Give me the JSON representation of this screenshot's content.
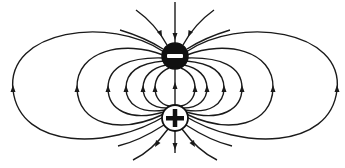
{
  "diagram": {
    "background": "#ffffff",
    "line_color": "#1a1a1a",
    "charges": [
      {
        "id": "negative",
        "sign": "−",
        "label": "negative-charge",
        "cx": 175,
        "cy": 56,
        "r": 13,
        "fill": "#111111",
        "symbol_color": "#ffffff"
      },
      {
        "id": "positive",
        "sign": "+",
        "label": "positive-charge",
        "cx": 175,
        "cy": 118,
        "r": 13,
        "fill": "#ffffff",
        "symbol_color": "#111111"
      }
    ],
    "field_direction": "from positive charge to negative charge",
    "closed_loop_count_per_side": 6,
    "open_lines_top": 5,
    "open_lines_bottom": 5
  }
}
